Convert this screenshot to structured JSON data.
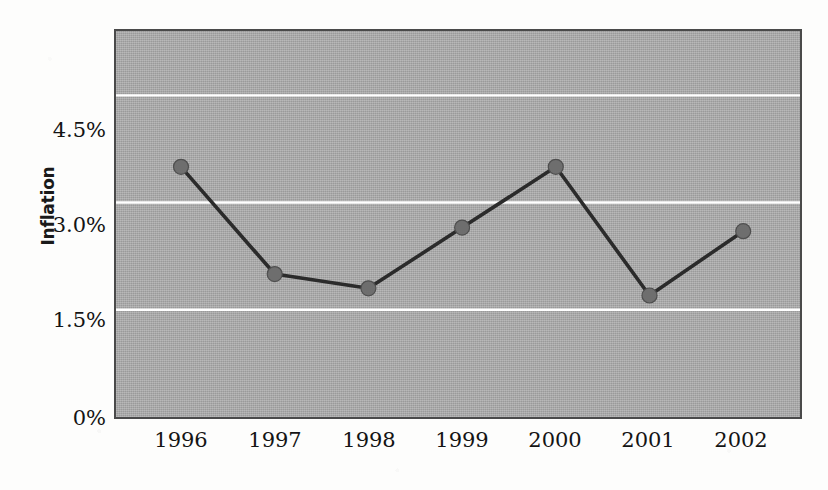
{
  "chart_data": {
    "type": "line",
    "title": "",
    "xlabel": "",
    "ylabel": "Inflation",
    "categories": [
      "1996",
      "1997",
      "1998",
      "1999",
      "2000",
      "2001",
      "2002"
    ],
    "values": [
      3.5,
      2.0,
      1.8,
      2.65,
      3.5,
      1.7,
      2.6
    ],
    "series": [
      {
        "name": "Inflation",
        "values": [
          3.5,
          2.0,
          1.8,
          2.65,
          3.5,
          1.7,
          2.6
        ]
      }
    ],
    "ylim": [
      0,
      5.4
    ],
    "xlim": [
      0,
      8
    ],
    "y_tick_labels": [
      "4.5%",
      "3.0%",
      "1.5%",
      "0%"
    ],
    "y_tick_values": [
      4.5,
      3.0,
      1.5,
      0
    ],
    "x_tick_labels": [
      "1996",
      "1997",
      "1998",
      "1999",
      "2000",
      "2001",
      "2002"
    ],
    "grid": {
      "horizontal": true,
      "vertical": false,
      "color": "#ffffff"
    },
    "legend": {
      "visible": false,
      "position": "none"
    },
    "colors": {
      "plot_background": "#a9a9a9",
      "plot_border": "#4a4a4a",
      "line": "#2b2b2b",
      "marker": "#6e6e6e",
      "marker_border": "#4f4f4f",
      "gridline": "#ffffff",
      "text": "#141414",
      "page_background": "#fdfdfc"
    }
  }
}
